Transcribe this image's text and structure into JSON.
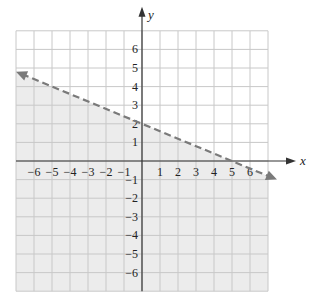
{
  "chart_data": {
    "type": "line",
    "title": "",
    "xlabel": "x",
    "ylabel": "y",
    "xlim": [
      -7,
      7
    ],
    "ylim": [
      -7,
      7
    ],
    "grid": true,
    "x_ticks": [
      -6,
      -5,
      -4,
      -3,
      -2,
      -1,
      1,
      2,
      3,
      4,
      5,
      6
    ],
    "y_ticks": [
      6,
      5,
      4,
      3,
      2,
      1,
      -1,
      -2,
      -3,
      -4,
      -5,
      -6
    ],
    "x_tick_labels": [
      "−6",
      "−5",
      "−4",
      "−3",
      "−2",
      "−1",
      "1",
      "2",
      "3",
      "4",
      "5",
      "6"
    ],
    "y_tick_labels": [
      "6",
      "5",
      "4",
      "3",
      "2",
      "1",
      "−1",
      "−2",
      "−3",
      "−4",
      "−5",
      "−6"
    ],
    "series": [
      {
        "name": "boundary line",
        "equation": "y = -0.4x + 2",
        "style": "dashed",
        "arrows": "both",
        "x": [
          -7,
          7.5
        ],
        "y": [
          4.8,
          -1
        ]
      }
    ],
    "shaded_region": {
      "inequality": "y < -0.4x + 2",
      "side": "below",
      "boundary": "dashed (not included)"
    }
  },
  "colors": {
    "grid": "#c8c8c8",
    "axis": "#333333",
    "boundary": "#7a7a7a",
    "shade": "#ececec"
  }
}
